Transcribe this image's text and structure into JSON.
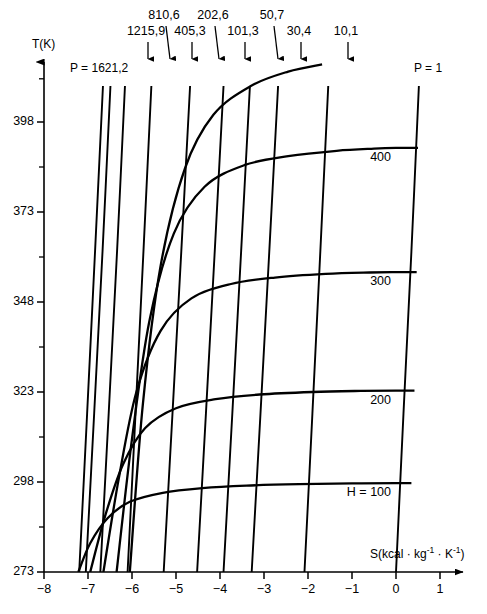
{
  "axes": {
    "y_title": "T(K)",
    "x_title_parts": {
      "main": "S(kcal · kg",
      "sup1": "-1",
      "mid": " · K",
      "sup2": "-1",
      "close": ")"
    },
    "x_title_plain": "S(kcal · kg-1 · K-1)",
    "y_ticks": [
      "273",
      "298",
      "323",
      "348",
      "373",
      "398"
    ],
    "x_ticks": [
      "-8",
      "-7",
      "-6",
      "-5",
      "-4",
      "-3",
      "-2",
      "-1",
      "0",
      "1"
    ]
  },
  "pressure_labels": {
    "left_label": "P = 1621,2",
    "right_label": "P = 1",
    "arrow_labels": [
      "1215,9",
      "810,6",
      "405,3",
      "202,6",
      "101,3",
      "50,7",
      "30,4",
      "10,1"
    ]
  },
  "enthalpy_labels": {
    "first": "H = 100",
    "rest": [
      "200",
      "300",
      "400"
    ]
  },
  "colors": {
    "line": "#000000",
    "background": "#ffffff",
    "text": "#000000"
  },
  "chart_data": {
    "type": "line",
    "title": "",
    "subtitle": "",
    "xlabel": "S(kcal · kg-1 · K-1)",
    "ylabel": "T(K)",
    "xlim": [
      -8,
      1
    ],
    "ylim": [
      273,
      410
    ],
    "grid": false,
    "legend_position": "inline-annotations",
    "annotations": [
      {
        "text": "P = 1621,2",
        "x": -7.3,
        "y": 405,
        "kind": "isobar-label"
      },
      {
        "text": "1215,9",
        "x": -6.65,
        "y": 412,
        "kind": "isobar-arrow-label"
      },
      {
        "text": "810,6",
        "x": -6.2,
        "y": 418,
        "kind": "isobar-arrow-label"
      },
      {
        "text": "405,3",
        "x": -5.7,
        "y": 412,
        "kind": "isobar-arrow-label"
      },
      {
        "text": "202,6",
        "x": -5.1,
        "y": 418,
        "kind": "isobar-arrow-label"
      },
      {
        "text": "101,3",
        "x": -4.45,
        "y": 412,
        "kind": "isobar-arrow-label"
      },
      {
        "text": "50,7",
        "x": -3.9,
        "y": 418,
        "kind": "isobar-arrow-label"
      },
      {
        "text": "30,4",
        "x": -3.4,
        "y": 412,
        "kind": "isobar-arrow-label"
      },
      {
        "text": "10,1",
        "x": -2.3,
        "y": 412,
        "kind": "isobar-arrow-label"
      },
      {
        "text": "P = 1",
        "x": -0.2,
        "y": 405,
        "kind": "isobar-label"
      },
      {
        "text": "H = 100",
        "x": -0.55,
        "y": 296,
        "kind": "isenthalp-label"
      },
      {
        "text": "200",
        "x": -0.55,
        "y": 320,
        "kind": "isenthalp-label"
      },
      {
        "text": "300",
        "x": -0.6,
        "y": 352,
        "kind": "isenthalp-label"
      },
      {
        "text": "400",
        "x": -0.6,
        "y": 388,
        "kind": "isenthalp-label"
      }
    ],
    "series": [
      {
        "name": "P = 1621,2",
        "kind": "isobar",
        "pressure_mbar": 1621.2,
        "x": [
          -7.2,
          -7.02,
          -6.84,
          -6.66
        ],
        "y": [
          273,
          317,
          362,
          408
        ]
      },
      {
        "name": "1215,9",
        "kind": "isobar",
        "pressure_mbar": 1215.9,
        "x": [
          -7.05,
          -6.86,
          -6.67,
          -6.49
        ],
        "y": [
          273,
          317,
          362,
          408
        ]
      },
      {
        "name": "810,6",
        "kind": "isobar",
        "pressure_mbar": 810.6,
        "x": [
          -6.72,
          -6.53,
          -6.34,
          -6.16
        ],
        "y": [
          273,
          317,
          362,
          408
        ]
      },
      {
        "name": "405,3",
        "kind": "isobar",
        "pressure_mbar": 405.3,
        "x": [
          -6.1,
          -5.92,
          -5.74,
          -5.56
        ],
        "y": [
          273,
          317,
          362,
          408
        ]
      },
      {
        "name": "202,6",
        "kind": "isobar",
        "pressure_mbar": 202.6,
        "x": [
          -5.28,
          -5.08,
          -4.88,
          -4.68
        ],
        "y": [
          273,
          317,
          362,
          408
        ]
      },
      {
        "name": "101,3",
        "kind": "isobar",
        "pressure_mbar": 101.3,
        "x": [
          -4.52,
          -4.32,
          -4.12,
          -3.92
        ],
        "y": [
          273,
          317,
          362,
          408
        ]
      },
      {
        "name": "50,7",
        "kind": "isobar",
        "pressure_mbar": 50.7,
        "x": [
          -3.92,
          -3.72,
          -3.52,
          -3.32
        ],
        "y": [
          273,
          317,
          362,
          408
        ]
      },
      {
        "name": "30,4",
        "kind": "isobar",
        "pressure_mbar": 30.4,
        "x": [
          -3.28,
          -3.08,
          -2.88,
          -2.68
        ],
        "y": [
          273,
          317,
          362,
          408
        ]
      },
      {
        "name": "10,1",
        "kind": "isobar",
        "pressure_mbar": 10.1,
        "x": [
          -2.08,
          -1.9,
          -1.72,
          -1.54
        ],
        "y": [
          273,
          317,
          362,
          408
        ]
      },
      {
        "name": "P = 1",
        "kind": "isobar",
        "pressure_mbar": 1.0,
        "x": [
          0.0,
          0.17,
          0.35,
          0.52
        ],
        "y": [
          273,
          317,
          362,
          408
        ]
      },
      {
        "name": "H = 100",
        "kind": "isenthalp",
        "enthalpy": 100,
        "x": [
          -7.22,
          -6.95,
          -6.55,
          -6.05,
          -5.3,
          -4.4,
          -3.4,
          -2.2,
          -1.0,
          0.0,
          0.35
        ],
        "y": [
          273.0,
          281.0,
          288.0,
          292.5,
          295.0,
          296.3,
          297.0,
          297.4,
          297.6,
          297.7,
          297.7
        ]
      },
      {
        "name": "200",
        "kind": "isenthalp",
        "enthalpy": 200,
        "x": [
          -6.95,
          -6.6,
          -6.2,
          -5.7,
          -5.0,
          -4.1,
          -3.1,
          -1.9,
          -0.8,
          0.0,
          0.42
        ],
        "y": [
          273.0,
          289.0,
          303.0,
          313.0,
          318.5,
          321.0,
          322.3,
          323.0,
          323.3,
          323.4,
          323.4
        ]
      },
      {
        "name": "300",
        "kind": "isenthalp",
        "enthalpy": 300,
        "x": [
          -6.65,
          -6.3,
          -5.9,
          -5.35,
          -4.65,
          -3.75,
          -2.75,
          -1.6,
          -0.6,
          0.0,
          0.47
        ],
        "y": [
          273.0,
          299.0,
          323.0,
          340.0,
          349.0,
          353.0,
          354.8,
          355.8,
          356.2,
          356.3,
          356.3
        ]
      },
      {
        "name": "400",
        "kind": "isenthalp",
        "enthalpy": 400,
        "x": [
          -6.35,
          -6.0,
          -5.6,
          -5.05,
          -4.35,
          -3.45,
          -2.45,
          -1.35,
          -0.5,
          0.0,
          0.5
        ],
        "y": [
          273.0,
          310.0,
          343.0,
          367.0,
          380.0,
          386.0,
          388.5,
          390.0,
          390.6,
          390.8,
          390.8
        ]
      },
      {
        "name": "500",
        "kind": "isenthalp",
        "enthalpy": 500,
        "labelled": false,
        "x": [
          -6.05,
          -5.75,
          -5.35,
          -4.8,
          -4.15,
          -3.3,
          -2.45,
          -1.68
        ],
        "y": [
          273.0,
          320.0,
          358.0,
          385.0,
          400.0,
          408.0,
          412.0,
          414.0
        ]
      }
    ]
  }
}
